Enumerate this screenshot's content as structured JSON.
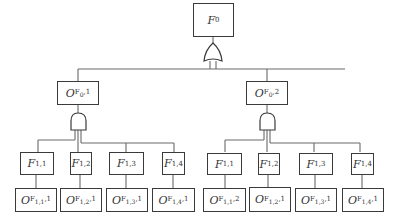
{
  "diagram": {
    "type": "fault-tree",
    "root": {
      "label": "F",
      "sub": "0"
    },
    "root_gate": "or-gate",
    "branches": [
      {
        "node": {
          "label": "O",
          "sub": "F",
          "subsub": "0",
          "suffix": ",1"
        },
        "gate": "and-gate",
        "children": [
          {
            "f": {
              "label": "F",
              "sub": "1,1"
            },
            "o": {
              "label": "O",
              "sub": "F",
              "subsub": "1,1",
              "suffix": ",1"
            }
          },
          {
            "f": {
              "label": "F",
              "sub": "1,2"
            },
            "o": {
              "label": "O",
              "sub": "F",
              "subsub": "1,2",
              "suffix": ",1"
            }
          },
          {
            "f": {
              "label": "F",
              "sub": "1,3"
            },
            "o": {
              "label": "O",
              "sub": "F",
              "subsub": "1,3",
              "suffix": ",1"
            }
          },
          {
            "f": {
              "label": "F",
              "sub": "1,4"
            },
            "o": {
              "label": "O",
              "sub": "F",
              "subsub": "1,4",
              "suffix": ",1"
            }
          }
        ]
      },
      {
        "node": {
          "label": "O",
          "sub": "F",
          "subsub": "0",
          "suffix": ",2"
        },
        "gate": "and-gate",
        "children": [
          {
            "f": {
              "label": "F",
              "sub": "1,1"
            },
            "o": {
              "label": "O",
              "sub": "F",
              "subsub": "1,1",
              "suffix": ",2"
            }
          },
          {
            "f": {
              "label": "F",
              "sub": "1,2"
            },
            "o": {
              "label": "O",
              "sub": "F",
              "subsub": "1,2",
              "suffix": ",1"
            }
          },
          {
            "f": {
              "label": "F",
              "sub": "1,3"
            },
            "o": {
              "label": "O",
              "sub": "F",
              "subsub": "1,3",
              "suffix": ",1"
            }
          },
          {
            "f": {
              "label": "F",
              "sub": "1,4"
            },
            "o": {
              "label": "O",
              "sub": "F",
              "subsub": "1,4",
              "suffix": ",1"
            }
          }
        ]
      }
    ],
    "colors": {
      "line": "#555555",
      "box_border": "#3a3a3a",
      "text": "#333333"
    }
  }
}
